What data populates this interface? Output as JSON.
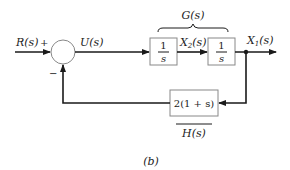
{
  "diagram": {
    "type": "block-diagram",
    "caption": "(b)",
    "input": {
      "label_main": "R",
      "label_arg": "(s)"
    },
    "summing_junction": {
      "plus_sign": "+",
      "minus_sign": "−"
    },
    "signals": {
      "u": {
        "label_main": "U",
        "label_arg": "(s)"
      },
      "x2": {
        "label_main": "X",
        "sub": "2",
        "label_arg": "(s)"
      },
      "x1": {
        "label_main": "X",
        "sub": "1",
        "label_arg": "(s)"
      }
    },
    "forward_group": {
      "label": "G(s)"
    },
    "blocks": [
      {
        "id": "integrator-1",
        "numerator": "1",
        "denominator": "s"
      },
      {
        "id": "integrator-2",
        "numerator": "1",
        "denominator": "s"
      },
      {
        "id": "feedback",
        "text": "2(1 + s)"
      }
    ],
    "feedback_group": {
      "label": "H(s)"
    },
    "colors": {
      "line": "#1a1a1a",
      "box_border": "#888888",
      "background": "#ffffff"
    }
  }
}
